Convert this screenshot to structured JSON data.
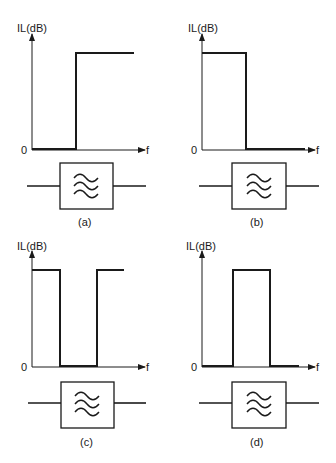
{
  "panels": [
    {
      "id": "a",
      "caption": "(a)",
      "type": "high-pass",
      "ylabel": "IL(dB)",
      "zero": "0",
      "xlabel": "f"
    },
    {
      "id": "b",
      "caption": "(b)",
      "type": "low-pass",
      "ylabel": "IL(dB)",
      "zero": "0",
      "xlabel": "f"
    },
    {
      "id": "c",
      "caption": "(c)",
      "type": "band-pass",
      "ylabel": "IL(dB)",
      "zero": "0",
      "xlabel": "f"
    },
    {
      "id": "d",
      "caption": "(d)",
      "type": "band-stop",
      "ylabel": "IL(dB)",
      "zero": "0",
      "xlabel": "f"
    }
  ],
  "colors": {
    "line": "#1a1a1a",
    "background": "#ffffff"
  }
}
